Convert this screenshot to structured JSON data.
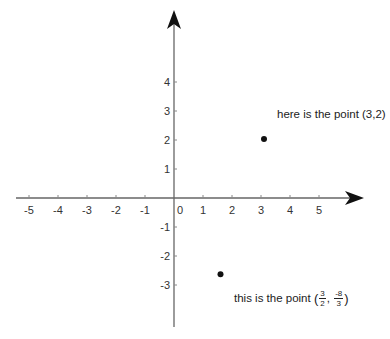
{
  "chart_data": {
    "type": "scatter",
    "title": "",
    "xlabel": "",
    "ylabel": "",
    "xlim": [
      -5.5,
      6.5
    ],
    "ylim": [
      -3.5,
      4.7
    ],
    "grid": false,
    "x_ticks": [
      -5,
      -4,
      -3,
      -2,
      -1,
      0,
      1,
      2,
      3,
      4,
      5
    ],
    "y_ticks": [
      4,
      3,
      2,
      1,
      -1,
      -2,
      -3
    ],
    "x_tick_labels": [
      "-5",
      "-4",
      "-3",
      "-2",
      "-1",
      "0",
      "1",
      "2",
      "3",
      "4",
      "5"
    ],
    "y_tick_labels": [
      "4",
      "3",
      "2",
      "1",
      "-1",
      "-2",
      "-3"
    ],
    "points": [
      {
        "x": 3,
        "y": 2,
        "label": "here is the point (3,2)"
      },
      {
        "x": 1.5,
        "y": -2.6667,
        "label": "this is the point (3/2, -8/3)"
      }
    ],
    "annotations": [
      {
        "text": "here is the point (3,2)",
        "x": 3,
        "y": 2
      },
      {
        "text_prefix": "this is the point",
        "frac1_num": "3",
        "frac1_den": "2",
        "frac2_num": "-8",
        "frac2_den": "3",
        "x": 1.5,
        "y": -2.6667
      }
    ],
    "colors": {
      "axis": "#555555",
      "arrow": "#111111",
      "point": "#111111",
      "text": "#222222"
    }
  },
  "annotation1": {
    "text": "here is the point (3,2)"
  },
  "annotation2": {
    "prefix": "this is the point",
    "open": "(",
    "comma": ",",
    "close": ")",
    "f1_num": "3",
    "f1_den": "2",
    "f2_num": "-8",
    "f2_den": "3"
  }
}
